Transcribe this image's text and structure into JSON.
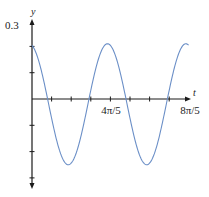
{
  "chart_data": {
    "type": "line",
    "title": "",
    "xlabel": "t",
    "ylabel": "y",
    "x_tick_labels": [
      {
        "value": 2.5133,
        "label": "4π/5"
      },
      {
        "value": 5.0265,
        "label": "8π/5"
      }
    ],
    "x_tick_step": 0.6283,
    "x_tick_count": 8,
    "y_tick_labels": [
      {
        "value": 0.3,
        "label": "0.3"
      }
    ],
    "y_tick_values": [
      0.2,
      0.1,
      -0.1,
      -0.2,
      -0.3
    ],
    "xlim": [
      0,
      5.03
    ],
    "ylim": [
      -0.3,
      0.3
    ],
    "grid": false,
    "legend": null,
    "series": [
      {
        "name": "y(t)",
        "color": "#6b8fc7",
        "x": [
          0,
          0.2,
          0.4,
          0.6,
          0.8,
          1.0,
          1.2,
          1.4,
          1.6,
          1.8,
          2.0,
          2.2,
          2.4,
          2.6,
          2.8,
          3.0,
          3.2,
          3.4,
          3.6,
          3.8,
          4.0,
          4.2,
          4.4,
          4.6,
          4.8,
          5.0
        ],
        "y": [
          0.2,
          0.12,
          -0.02,
          -0.15,
          -0.23,
          -0.24,
          -0.18,
          -0.07,
          0.06,
          0.16,
          0.21,
          0.2,
          0.13,
          -0.02,
          -0.14,
          -0.23,
          -0.25,
          -0.19,
          -0.08,
          0.05,
          0.15,
          0.21,
          0.2,
          0.14,
          0.02,
          -0.01
        ]
      }
    ],
    "function_hint": {
      "amplitude": 0.23,
      "omega": 2.5,
      "t_peak": 2.42,
      "offset": -0.02
    }
  },
  "labels": {
    "y_axis": "y",
    "x_axis": "t",
    "y_max": "0.3",
    "x_tick_1": "4π/5",
    "x_tick_2": "8π/5"
  },
  "colors": {
    "curve": "#6b8fc7",
    "axis": "#1a1a1a"
  }
}
